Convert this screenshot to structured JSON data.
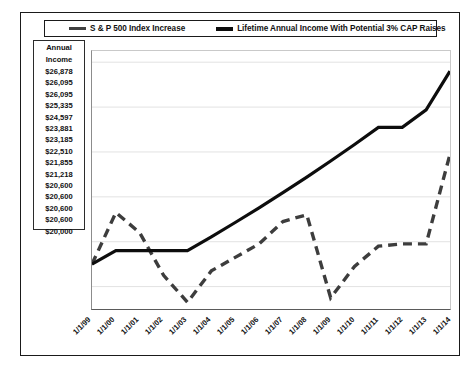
{
  "legend": {
    "entries": [
      {
        "label": "S & P 500 Index Increase",
        "style": "dashed",
        "color": "#404040",
        "icon": "legend-line-dashed"
      },
      {
        "label": "Lifetime Annual  Income With Potential  3% CAP Raises",
        "style": "solid",
        "color": "#0d0d0d",
        "icon": "legend-line-solid"
      }
    ]
  },
  "income_table": {
    "header_line1": "Annual",
    "header_line2": "Income",
    "values": [
      "$26,878",
      "$26,095",
      "$26,095",
      "$25,335",
      "$24,597",
      "$23,881",
      "$23,185",
      "$22,510",
      "$21,855",
      "$21,218",
      "$20,600",
      "$20,600",
      "$20,600",
      "$20,600",
      "$20,000"
    ]
  },
  "chart_data": {
    "type": "line",
    "title": "",
    "xlabel": "",
    "ylabel": "",
    "grid": true,
    "legend_position": "top",
    "categories": [
      "1/1/99",
      "1/1/00",
      "1/1/01",
      "1/1/02",
      "1/1/03",
      "1/1/04",
      "1/1/05",
      "1/1/06",
      "1/1/07",
      "1/1/08",
      "1/1/09",
      "1/1/10",
      "1/1/11",
      "1/1/12",
      "1/1/13",
      "1/1/14"
    ],
    "ylim": [
      18000,
      29500
    ],
    "yticks": [
      19000,
      21000,
      23000,
      25000,
      27000,
      29000
    ],
    "series": [
      {
        "name": "S & P 500 Index Increase",
        "style": "dashed",
        "color": "#3d3d3d",
        "values": [
          20000,
          22300,
          21400,
          19500,
          18300,
          19700,
          20300,
          20900,
          21900,
          22200,
          18500,
          19900,
          20800,
          20900,
          20900,
          24900
        ]
      },
      {
        "name": "Lifetime Annual  Income With Potential  3% CAP Raises",
        "style": "solid",
        "color": "#0d0d0d",
        "values": [
          20000,
          20600,
          20600,
          20600,
          20600,
          21218,
          21855,
          22510,
          23185,
          23881,
          24597,
          25335,
          26095,
          26095,
          26878,
          28600
        ]
      }
    ]
  }
}
